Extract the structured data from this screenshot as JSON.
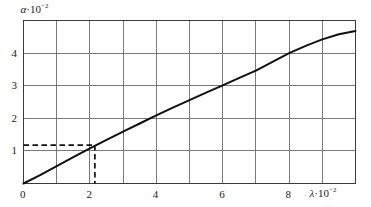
{
  "chart_data": {
    "type": "line",
    "title": "",
    "subtitle": "",
    "xlabel": "λ·10⁻²",
    "ylabel": "α·10⁻²",
    "xlabel_symbol": "λ",
    "xlabel_factor": "·10",
    "xlabel_exponent": "−2",
    "ylabel_symbol": "α",
    "ylabel_factor": "·10",
    "ylabel_exponent": "−2",
    "xlim": [
      0,
      10
    ],
    "ylim": [
      0,
      5
    ],
    "grid": true,
    "grid_x_lines": [
      0,
      1,
      2,
      3,
      4,
      5,
      6,
      7,
      8,
      9,
      10
    ],
    "grid_y_lines": [
      0,
      1,
      2,
      3,
      4,
      5
    ],
    "xticks": [
      0,
      2,
      4,
      6,
      8
    ],
    "xtick_labels": [
      "0",
      "2",
      "4",
      "6",
      "8"
    ],
    "yticks": [
      1,
      2,
      3,
      4
    ],
    "ytick_labels": [
      "1",
      "2",
      "3",
      "4"
    ],
    "series": [
      {
        "name": "absorption-curve",
        "x": [
          0.0,
          0.5,
          1.0,
          1.5,
          2.0,
          2.5,
          3.0,
          3.5,
          4.0,
          4.5,
          5.0,
          5.5,
          6.0,
          6.5,
          7.0,
          7.5,
          8.0,
          8.5,
          9.0,
          9.5,
          10.0
        ],
        "y": [
          0.0,
          0.26,
          0.53,
          0.81,
          1.08,
          1.34,
          1.59,
          1.84,
          2.09,
          2.33,
          2.56,
          2.79,
          3.01,
          3.24,
          3.46,
          3.73,
          4.0,
          4.22,
          4.42,
          4.58,
          4.68
        ]
      }
    ],
    "annotations": [
      {
        "name": "construction-lines",
        "style": "dashed",
        "point_x": 2.15,
        "point_y": 1.18,
        "horizontal_from_x": 0,
        "vertical_to_y": 0
      }
    ],
    "colors": {
      "curve": "#101010",
      "grid": "#6b6b6b",
      "axis": "#3a3a3a",
      "dashed": "#101010",
      "text": "#1a1a1a",
      "background": "#ffffff"
    }
  }
}
